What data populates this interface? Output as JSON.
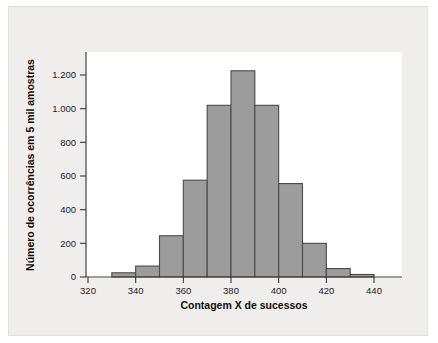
{
  "figure": {
    "background_color": "#ffffff",
    "frame_color": "#efeeec",
    "plot_background": "#ffffff"
  },
  "chart_data": {
    "type": "bar",
    "title": "",
    "subtitle": "",
    "xlabel": "Contagem X de sucessos",
    "ylabel": "Número de ocorrências em 5 mil amostras",
    "xlim": [
      315,
      455
    ],
    "ylim": [
      0,
      1290
    ],
    "grid": false,
    "legend": null,
    "bar_color": "#9c9c9c",
    "bar_edge_color": "#4a4a4a",
    "bin_width": 10,
    "bin_edges": [
      330,
      340,
      350,
      360,
      370,
      380,
      390,
      400,
      410,
      420,
      430,
      440,
      450
    ],
    "categories": [
      "330-340",
      "340-350",
      "350-360",
      "360-370",
      "370-380",
      "380-390",
      "390-400",
      "400-410",
      "410-420",
      "420-430",
      "430-440",
      "440-450"
    ],
    "bin_centers": [
      335,
      345,
      355,
      365,
      375,
      385,
      395,
      405,
      415,
      425,
      435,
      445
    ],
    "values": [
      25,
      65,
      245,
      575,
      1020,
      1225,
      1020,
      555,
      200,
      50,
      15,
      0
    ],
    "xticks": [
      320,
      340,
      360,
      380,
      400,
      420,
      440
    ],
    "xtick_labels": [
      "320",
      "340",
      "360",
      "380",
      "400",
      "420",
      "440"
    ],
    "yticks": [
      0,
      200,
      400,
      600,
      800,
      1000,
      1200
    ],
    "ytick_labels": [
      "0",
      "200",
      "400",
      "600",
      "800",
      "1.000",
      "1.200"
    ]
  }
}
